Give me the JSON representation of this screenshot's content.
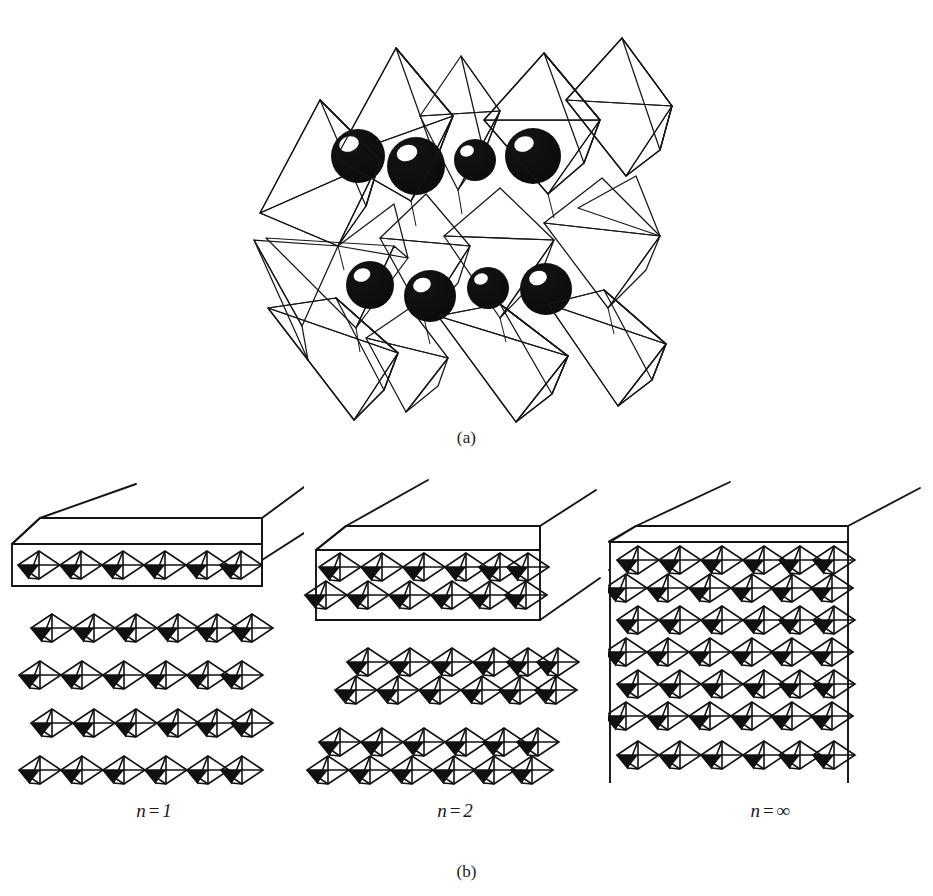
{
  "figure": {
    "type": "crystal-structure-diagram",
    "panels": [
      {
        "id": "a",
        "label": "(a)",
        "content": "Three-dimensional polyhedral model of corner-sharing octahedra with large black cation spheres between the layers",
        "elements": {
          "octahedra_count": 12,
          "sphere_count": 8,
          "shaded_face_pattern": "stipple-halftone",
          "sphere_color": "#121212",
          "sphere_highlight_color": "#ffffff",
          "outline_color": "#161616"
        }
      },
      {
        "id": "b",
        "label": "(b)",
        "content": "Schematic of Ruddlesden-Popper members showing slabs of n perovskite layers",
        "columns": [
          {
            "caption_n": "n",
            "caption_eq": "=",
            "caption_value": "1",
            "caption_full": "n = 1",
            "layers_per_slab": 1,
            "octahedra_per_row": 6,
            "free_slabs": 4,
            "boxed": true,
            "box_style": "closed-slab"
          },
          {
            "caption_n": "n",
            "caption_eq": "=",
            "caption_value": "2",
            "caption_full": "n = 2",
            "layers_per_slab": 2,
            "octahedra_per_row": 6,
            "free_slabs": 2,
            "boxed": true,
            "box_style": "closed-slab"
          },
          {
            "caption_n": "n",
            "caption_eq": "=",
            "caption_value": "∞",
            "caption_full": "n = ∞",
            "layers_per_slab": 7,
            "octahedra_per_row": 6,
            "free_slabs": 0,
            "boxed": true,
            "box_style": "open-bottom-block"
          }
        ]
      }
    ],
    "colors": {
      "background": "#ffffff",
      "ink": "#161616",
      "octahedron_shade": "#111111",
      "stipple": "#8a8a8a"
    }
  }
}
